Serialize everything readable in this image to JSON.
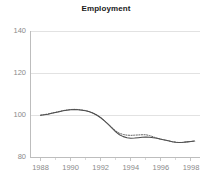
{
  "chart_data": {
    "type": "line",
    "title": "Employment",
    "xlabel": "",
    "ylabel": "",
    "xlim": [
      1987.3,
      1998.6
    ],
    "ylim": [
      80,
      140
    ],
    "grid": true,
    "legend_position": "none",
    "y_ticks": [
      80,
      100,
      120,
      140
    ],
    "y_tick_labels": [
      "80",
      "100",
      "120",
      "140"
    ],
    "x_ticks": [
      1988,
      1990,
      1992,
      1994,
      1996,
      1998
    ],
    "x_tick_labels": [
      "1988",
      "1990",
      "1992",
      "1994",
      "1996",
      "1998"
    ],
    "x_minor_ticks": [
      1989,
      1991,
      1993,
      1995,
      1997
    ],
    "x": [
      1988.0,
      1988.25,
      1988.5,
      1988.75,
      1989.0,
      1989.25,
      1989.5,
      1989.75,
      1990.0,
      1990.25,
      1990.5,
      1990.75,
      1991.0,
      1991.25,
      1991.5,
      1991.75,
      1992.0,
      1992.25,
      1992.5,
      1992.75,
      1993.0,
      1993.25,
      1993.5,
      1993.75,
      1994.0,
      1994.25,
      1994.5,
      1994.75,
      1995.0,
      1995.25,
      1995.5,
      1995.75,
      1996.0,
      1996.25,
      1996.5,
      1996.75,
      1997.0,
      1997.25,
      1997.5,
      1997.75,
      1998.0,
      1998.25
    ],
    "series": [
      {
        "name": "solid",
        "style": "solid",
        "color": "#4a4a4a",
        "values": [
          99.9,
          100.1,
          100.4,
          100.8,
          101.2,
          101.6,
          102.0,
          102.3,
          102.5,
          102.6,
          102.5,
          102.3,
          102.0,
          101.5,
          100.8,
          99.9,
          98.7,
          97.2,
          95.5,
          93.7,
          92.0,
          90.6,
          89.7,
          89.2,
          88.9,
          89.0,
          89.2,
          89.4,
          89.5,
          89.4,
          89.2,
          88.9,
          88.5,
          88.1,
          87.7,
          87.3,
          87.0,
          86.9,
          87.0,
          87.2,
          87.4,
          87.6
        ]
      },
      {
        "name": "dotted",
        "style": "dotted",
        "color": "#555555",
        "values": [
          99.9,
          100.2,
          100.5,
          100.9,
          101.3,
          101.7,
          102.1,
          102.4,
          102.6,
          102.7,
          102.6,
          102.4,
          102.1,
          101.6,
          100.9,
          100.0,
          98.8,
          97.3,
          95.7,
          94.0,
          92.4,
          91.3,
          90.7,
          90.4,
          90.3,
          90.4,
          90.5,
          90.6,
          90.6,
          90.2,
          89.6,
          88.9,
          88.5,
          88.1,
          87.7,
          87.3,
          87.0,
          86.9,
          87.0,
          87.2,
          87.4,
          87.6
        ]
      }
    ],
    "colors": {
      "axis": "#bdbdbd",
      "grid": "#e2e2e2",
      "tick_text": "#8a8a8a",
      "title_text": "#1a1a1a",
      "line_primary": "#4a4a4a",
      "line_secondary": "#555555",
      "background": "#ffffff"
    }
  }
}
